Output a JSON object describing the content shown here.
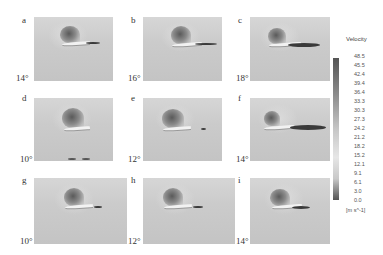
{
  "figure": {
    "panels": [
      {
        "label": "a",
        "angle": "14°"
      },
      {
        "label": "b",
        "angle": "16°"
      },
      {
        "label": "c",
        "angle": "18°"
      },
      {
        "label": "d",
        "angle": "10°"
      },
      {
        "label": "e",
        "angle": "12°"
      },
      {
        "label": "f",
        "angle": "14°"
      },
      {
        "label": "g",
        "angle": "10°"
      },
      {
        "label": "h",
        "angle": "12°"
      },
      {
        "label": "i",
        "angle": "14°"
      }
    ],
    "colorbar": {
      "title": "Velocity",
      "ticks": [
        "48.5",
        "45.5",
        "42.4",
        "39.4",
        "36.4",
        "33.3",
        "30.3",
        "27.3",
        "24.2",
        "21.2",
        "18.2",
        "15.2",
        "12.1",
        "9.1",
        "6.1",
        "3.0",
        "0.0"
      ],
      "unit": "[m s^-1]"
    }
  }
}
